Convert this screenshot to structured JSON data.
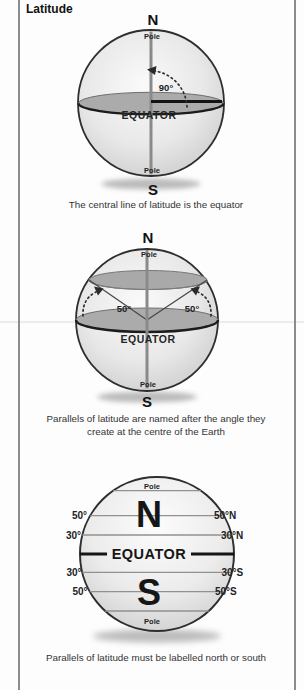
{
  "title": "Latitude",
  "colors": {
    "border_gray": "#8c8c8c",
    "globe_edge": "#b5b5b5",
    "equator_fill": "#ababab",
    "line_dark": "#1a1a1a",
    "axis_gray": "#8a8a8a"
  },
  "diagram1": {
    "north_label": "N",
    "south_label": "S",
    "pole_top": "Pole",
    "pole_bottom": "Pole",
    "equator_label": "EQUATOR",
    "angle_label": "90°",
    "caption": "The central line of latitude is the equator"
  },
  "diagram2": {
    "north_label": "N",
    "south_label": "S",
    "pole_top": "Pole",
    "pole_bottom": "Pole",
    "equator_label": "EQUATOR",
    "angle_left": "50°",
    "angle_right": "50°",
    "caption_line1": "Parallels of latitude are named after the angle they",
    "caption_line2": "create at the centre of the Earth"
  },
  "diagram3": {
    "pole_top": "Pole",
    "pole_bottom": "Pole",
    "north_label": "N",
    "south_label": "S",
    "equator_label": "EQUATOR",
    "left_labels": [
      "50°",
      "30°",
      "30°",
      "50°"
    ],
    "right_labels": [
      "50°N",
      "30°N",
      "30°S",
      "50°S"
    ],
    "caption": "Parallels of latitude must be labelled north or south"
  }
}
